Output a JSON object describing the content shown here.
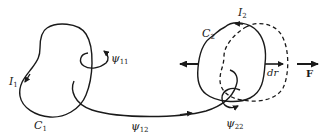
{
  "diagram": {
    "colors": {
      "stroke": "#1a1a1a",
      "background": "#ffffff"
    },
    "loop1": {
      "name": "C",
      "name_sub": "1",
      "current": "I",
      "current_sub": "1",
      "self_flux": "ψ",
      "self_flux_sub": "11"
    },
    "mutual_flux": {
      "symbol": "ψ",
      "sub": "12"
    },
    "loop2": {
      "name": "C",
      "name_sub": "2",
      "current": "I",
      "current_sub": "2",
      "self_flux": "ψ",
      "self_flux_sub": "22",
      "displacement": "dr",
      "displaced_outline": "dashed"
    },
    "force": {
      "label": "F"
    }
  }
}
